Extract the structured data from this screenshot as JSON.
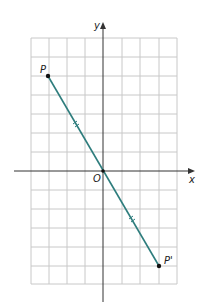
{
  "diagram": {
    "type": "coordinate-plane-reflection",
    "axes": {
      "x_label": "x",
      "y_label": "y",
      "origin_label": "O"
    },
    "grid": {
      "x_range": [
        -4,
        4
      ],
      "y_range": [
        -6,
        7
      ]
    },
    "points": [
      {
        "label": "P",
        "x": -3,
        "y": 5
      },
      {
        "label": "P'",
        "x": 3,
        "y": -5
      }
    ],
    "segment": {
      "from": "P",
      "to": "P'",
      "color": "#2e7d7d",
      "tick_marks": "double (congruent halves)"
    },
    "colors": {
      "grid": "#c8c8c8",
      "axis": "#333333",
      "segment": "#2e7d7d"
    }
  }
}
